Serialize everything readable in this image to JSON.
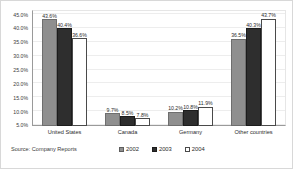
{
  "top_bleed_text": "",
  "source": "Source: Company Reports",
  "legend": {
    "items": [
      {
        "label": "2002",
        "color": "#8f8f8f",
        "swatch": "swatch-2002"
      },
      {
        "label": "2003",
        "color": "#2e2e2e",
        "swatch": "swatch-2003"
      },
      {
        "label": "2004",
        "color": "#ffffff",
        "swatch": "swatch-2004"
      }
    ]
  },
  "yaxis": {
    "ticks": [
      "45.0%",
      "40.0%",
      "35.0%",
      "30.0%",
      "25.0%",
      "20.0%",
      "15.0%",
      "10.0%",
      "5.0%"
    ]
  },
  "chart_data": {
    "type": "bar",
    "title": "",
    "subtitle": "",
    "xlabel": "",
    "ylabel": "",
    "ylim": [
      5.0,
      46.5
    ],
    "yticks": [
      45.0,
      40.0,
      35.0,
      30.0,
      25.0,
      20.0,
      15.0,
      10.0,
      5.0
    ],
    "ytick_labels": [
      "45.0%",
      "40.0%",
      "35.0%",
      "30.0%",
      "25.0%",
      "20.0%",
      "15.0%",
      "10.0%",
      "5.0%"
    ],
    "grid": true,
    "legend_position": "bottom",
    "categories": [
      "United States",
      "Canada",
      "Germany",
      "Other countries"
    ],
    "series": [
      {
        "name": "2002",
        "color": "#8f8f8f",
        "values": [
          43.6,
          9.7,
          10.2,
          36.5
        ],
        "labels": [
          "43.6%",
          "9.7%",
          "10.2%",
          "36.5%"
        ]
      },
      {
        "name": "2003",
        "color": "#2e2e2e",
        "values": [
          40.4,
          8.5,
          10.8,
          40.3
        ],
        "labels": [
          "40.4%",
          "8.5%",
          "10.8%",
          "40.3%"
        ]
      },
      {
        "name": "2004",
        "color": "#ffffff",
        "values": [
          36.6,
          7.8,
          11.9,
          43.7
        ],
        "labels": [
          "36.6%",
          "7.8%",
          "11.9%",
          "43.7%"
        ]
      }
    ],
    "annotations": [
      "Source: Company Reports"
    ]
  }
}
